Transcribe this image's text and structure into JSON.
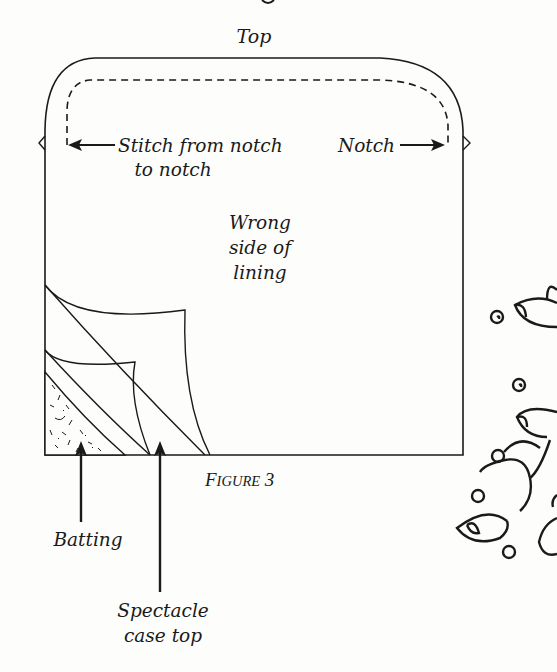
{
  "figure": {
    "caption_first": "F",
    "caption_rest": "IGURE",
    "caption_number": "3",
    "labels": {
      "top": "Top",
      "stitch_line1": "Stitch from notch",
      "stitch_line2": "to notch",
      "notch": "Notch",
      "wrong_line1": "Wrong",
      "wrong_line2": "side of",
      "wrong_line3": "lining",
      "batting": "Batting",
      "spectacle_line1": "Spectacle",
      "spectacle_line2": "case top"
    },
    "colors": {
      "ink": "#1a1a1a",
      "paper": "#fdfdfb"
    }
  }
}
